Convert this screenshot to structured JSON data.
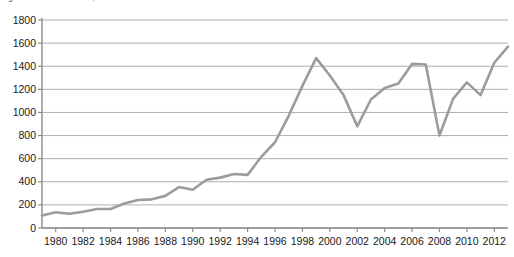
{
  "figure": {
    "caption": "Fig 1.2 The S&P 500 index, 1980 to 2013",
    "line_color": "#9c9c9c",
    "grid_color": "#9a9a9a",
    "axis_color": "#8c8c8c",
    "text_color": "#1a1a1a",
    "background": "#ffffff"
  },
  "chart_data": {
    "type": "line",
    "title": "Fig 1.2 The S&P 500 index, 1980 to 2013",
    "xlabel": "",
    "ylabel": "",
    "xlim": [
      1979,
      2013
    ],
    "ylim": [
      0,
      1800
    ],
    "ytick_labels": [
      "1800",
      "1600",
      "1400",
      "1200",
      "1000",
      "800",
      "600",
      "400",
      "200",
      "0"
    ],
    "yticks": [
      1800,
      1600,
      1400,
      1200,
      1000,
      800,
      600,
      400,
      200,
      0
    ],
    "xtick_labels": [
      "1980",
      "1982",
      "1984",
      "1986",
      "1988",
      "1990",
      "1992",
      "1994",
      "1996",
      "1998",
      "2000",
      "2002",
      "2004",
      "2006",
      "2008",
      "2010",
      "2012"
    ],
    "xticks": [
      1980,
      1982,
      1984,
      1986,
      1988,
      1990,
      1992,
      1994,
      1996,
      1998,
      2000,
      2002,
      2004,
      2006,
      2008,
      2010,
      2012
    ],
    "grid": "horizontal",
    "legend": null,
    "series": [
      {
        "name": "S&P 500 index",
        "x": [
          1979,
          1980,
          1981,
          1982,
          1983,
          1984,
          1985,
          1986,
          1987,
          1988,
          1989,
          1990,
          1991,
          1992,
          1993,
          1994,
          1995,
          1996,
          1997,
          1998,
          1999,
          2000,
          2001,
          2002,
          2003,
          2004,
          2005,
          2006,
          2007,
          2008,
          2009,
          2010,
          2011,
          2012,
          2013
        ],
        "values": [
          108,
          136,
          123,
          141,
          165,
          165,
          212,
          242,
          248,
          278,
          354,
          331,
          417,
          436,
          467,
          460,
          616,
          742,
          971,
          1230,
          1470,
          1320,
          1150,
          880,
          1112,
          1212,
          1250,
          1420,
          1415,
          800,
          1120,
          1260,
          1150,
          1430,
          1570
        ]
      }
    ],
    "annotations": []
  }
}
